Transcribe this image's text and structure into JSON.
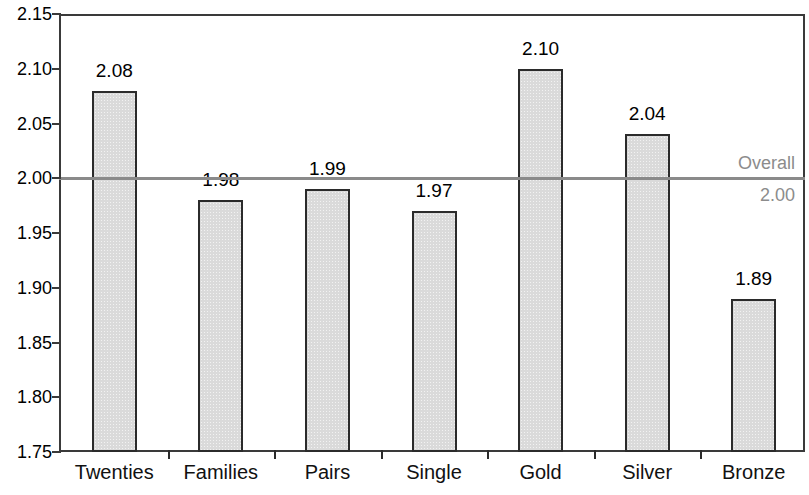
{
  "chart_data": {
    "type": "bar",
    "title": "",
    "subtitle": "",
    "xlabel": "",
    "ylabel": "",
    "categories": [
      "Twenties",
      "Families",
      "Pairs",
      "Single",
      "Gold",
      "Silver",
      "Bronze"
    ],
    "values": [
      2.08,
      1.98,
      1.99,
      1.97,
      2.1,
      2.04,
      1.89
    ],
    "value_labels": [
      "2.08",
      "1.98",
      "1.99",
      "1.97",
      "2.10",
      "2.04",
      "1.89"
    ],
    "ylim": [
      1.75,
      2.15
    ],
    "ytick_values": [
      2.15,
      2.1,
      2.05,
      2.0,
      1.95,
      1.9,
      1.85,
      1.8,
      1.75
    ],
    "ytick_labels": [
      "2.15",
      "2.10",
      "2.05",
      "2.00",
      "1.95",
      "1.90",
      "1.85",
      "1.80",
      "1.75"
    ],
    "grid": false,
    "legend": "none",
    "annotations": [
      {
        "name": "overall-reference-line",
        "label_top": "Overall",
        "label_bottom": "2.00",
        "value": 2.0,
        "color": "#8a8a8a"
      }
    ],
    "colors": {
      "bar_fill": "#dadada",
      "bar_border": "#2b2b2b",
      "axis": "#3a3a3a",
      "reference": "#8a8a8a",
      "text": "#000000",
      "background": "#ffffff"
    }
  }
}
